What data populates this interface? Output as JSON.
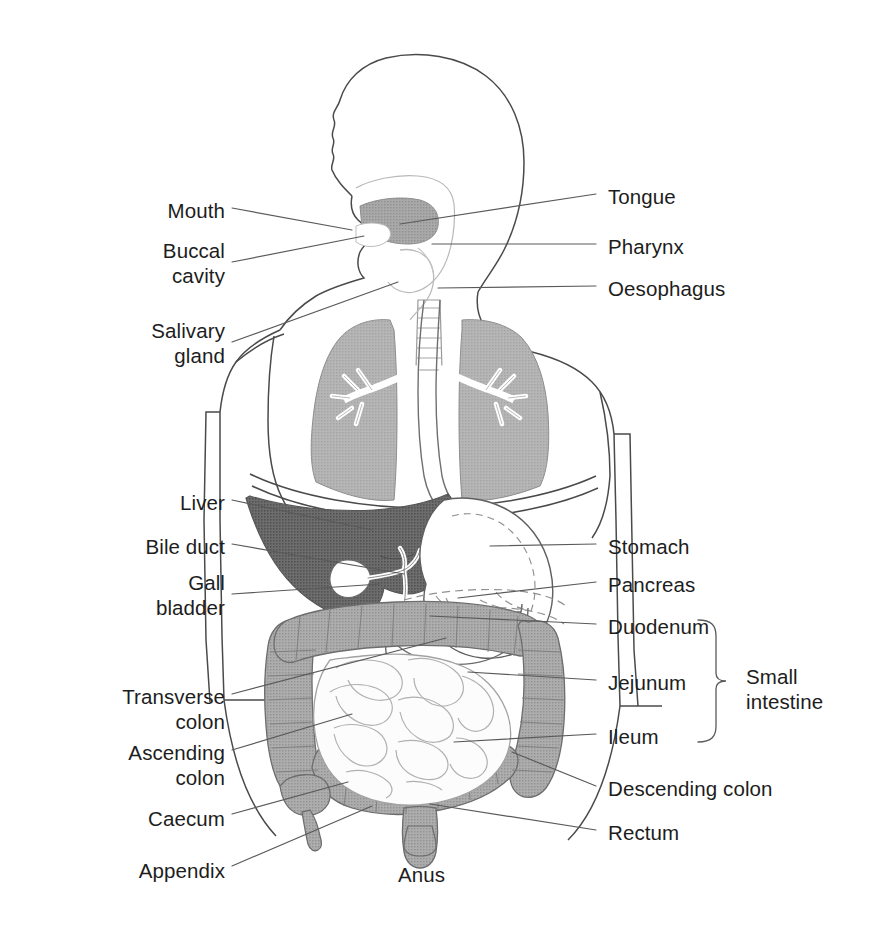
{
  "figure": {
    "type": "anatomical-diagram",
    "view": "Anterior body outline with head in left-facing profile",
    "style": "Black line drawing with halftone grey shading on white background"
  },
  "palette": {
    "background": "#ffffff",
    "outline": "#3c3c3c",
    "text": "#1d1d1d",
    "leader_line": "#5a5a5a",
    "liver_dark_grey": "#747474",
    "colon_grey": "#a6a6a6",
    "lung_grey": "#b0b0b0",
    "tongue_grey": "#9e9e9e",
    "organ_white": "#ffffff",
    "small_intestine": "#fbfbfb"
  },
  "labels_left": [
    {
      "id": "mouth",
      "text": "Mouth",
      "x": 83,
      "y": 198,
      "w": 142,
      "lead": [
        [
          232,
          208
        ],
        [
          352,
          230
        ]
      ]
    },
    {
      "id": "buccal-cavity",
      "text": "Buccal\ncavity",
      "x": 60,
      "y": 238,
      "w": 165,
      "lead": [
        [
          232,
          262
        ],
        [
          364,
          236
        ]
      ]
    },
    {
      "id": "salivary-gland",
      "text": "Salivary\ngland",
      "x": 60,
      "y": 318,
      "w": 165,
      "lead": [
        [
          232,
          342
        ],
        [
          398,
          282
        ]
      ]
    },
    {
      "id": "liver",
      "text": "Liver",
      "x": 95,
      "y": 490,
      "w": 130,
      "lead": [
        [
          232,
          500
        ],
        [
          372,
          530
        ]
      ]
    },
    {
      "id": "bile-duct",
      "text": "Bile duct",
      "x": 60,
      "y": 534,
      "w": 165,
      "lead": [
        [
          232,
          544
        ],
        [
          404,
          574
        ]
      ]
    },
    {
      "id": "gall-bladder",
      "text": "Gall\nbladder",
      "x": 60,
      "y": 570,
      "w": 165,
      "lead": [
        [
          232,
          594
        ],
        [
          380,
          584
        ]
      ]
    },
    {
      "id": "transverse-colon",
      "text": "Transverse\ncolon",
      "x": 40,
      "y": 684,
      "w": 185,
      "lead": [
        [
          232,
          694
        ],
        [
          446,
          638
        ]
      ]
    },
    {
      "id": "ascending-colon",
      "text": "Ascending\ncolon",
      "x": 40,
      "y": 740,
      "w": 185,
      "lead": [
        [
          232,
          750
        ],
        [
          352,
          714
        ]
      ]
    },
    {
      "id": "caecum",
      "text": "Caecum",
      "x": 60,
      "y": 806,
      "w": 165,
      "lead": [
        [
          232,
          814
        ],
        [
          348,
          782
        ]
      ]
    },
    {
      "id": "appendix",
      "text": "Appendix",
      "x": 55,
      "y": 858,
      "w": 170,
      "lead": [
        [
          232,
          866
        ],
        [
          372,
          806
        ]
      ]
    }
  ],
  "labels_right": [
    {
      "id": "tongue",
      "text": "Tongue",
      "x": 608,
      "y": 184,
      "lead": [
        [
          596,
          194
        ],
        [
          400,
          224
        ]
      ]
    },
    {
      "id": "pharynx",
      "text": "Pharynx",
      "x": 608,
      "y": 234,
      "lead": [
        [
          596,
          244
        ],
        [
          432,
          244
        ]
      ]
    },
    {
      "id": "oesophagus",
      "text": "Oesophagus",
      "x": 608,
      "y": 276,
      "lead": [
        [
          596,
          286
        ],
        [
          438,
          288
        ]
      ]
    },
    {
      "id": "stomach",
      "text": "Stomach",
      "x": 608,
      "y": 534,
      "lead": [
        [
          596,
          544
        ],
        [
          490,
          546
        ]
      ]
    },
    {
      "id": "pancreas",
      "text": "Pancreas",
      "x": 608,
      "y": 572,
      "lead": [
        [
          596,
          582
        ],
        [
          458,
          598
        ]
      ]
    },
    {
      "id": "duodenum",
      "text": "Duodenum",
      "x": 608,
      "y": 614,
      "lead": [
        [
          596,
          624
        ],
        [
          430,
          616
        ]
      ]
    },
    {
      "id": "jejunum",
      "text": "Jejunum",
      "x": 608,
      "y": 670,
      "lead": [
        [
          596,
          680
        ],
        [
          468,
          672
        ]
      ]
    },
    {
      "id": "ileum",
      "text": "Ileum",
      "x": 608,
      "y": 724,
      "lead": [
        [
          596,
          734
        ],
        [
          454,
          742
        ]
      ]
    },
    {
      "id": "descending-colon",
      "text": "Descending colon",
      "x": 608,
      "y": 776,
      "lead": [
        [
          596,
          786
        ],
        [
          512,
          752
        ]
      ]
    },
    {
      "id": "rectum",
      "text": "Rectum",
      "x": 608,
      "y": 820,
      "lead": [
        [
          596,
          830
        ],
        [
          430,
          804
        ]
      ]
    }
  ],
  "labels_center": [
    {
      "id": "anus",
      "text": "Anus",
      "x": 398,
      "y": 862
    }
  ],
  "group_bracket": {
    "id": "small-intestine",
    "text": "Small\nintestine",
    "text_x": 746,
    "text_y": 664,
    "brace_x": 716,
    "brace_top": 620,
    "brace_bottom": 742
  }
}
